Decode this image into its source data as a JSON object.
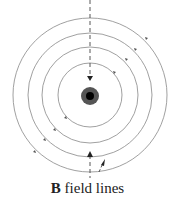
{
  "diagram": {
    "caption_bold": "B",
    "caption_rest": " field lines",
    "center": [
      90,
      95
    ],
    "radii": [
      32,
      48,
      62,
      77
    ],
    "line_color": "#888888",
    "wire_outer_color": "#555555",
    "wire_inner_color": "#000000",
    "dashed_line_color": "#444444"
  }
}
